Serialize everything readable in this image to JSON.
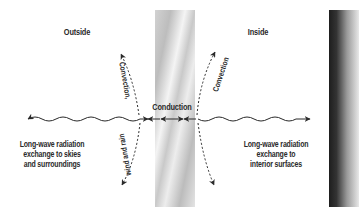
{
  "diagram": {
    "regions": {
      "outside_label": "Outside",
      "inside_label": "Inside"
    },
    "labels": {
      "conduction": "Conduction",
      "convection_outside": "Convection,",
      "wind_and_rain": "wind and rain",
      "convection_inside": "Convection",
      "longwave_outside": [
        "Long-wave radiation",
        "exchange to skies",
        "and surroundings"
      ],
      "longwave_inside": [
        "Long-wave radiation",
        "exchange to",
        "interior surfaces"
      ]
    },
    "elements": [
      {
        "id": "glazing-wall",
        "type": "wall",
        "style": "silver gradient",
        "x": 155,
        "width": 40
      },
      {
        "id": "interior-wall",
        "type": "wall",
        "style": "dark-to-light gradient",
        "x": 329,
        "width": 30
      },
      {
        "id": "outside-radiation",
        "type": "wavy-arrow",
        "direction": "bidirectional"
      },
      {
        "id": "inside-radiation",
        "type": "wavy-arrow",
        "direction": "bidirectional"
      },
      {
        "id": "conduction-arrows",
        "type": "double-arrow",
        "direction": "bidirectional"
      },
      {
        "id": "outside-convection",
        "type": "dashed-arc-arrow",
        "direction": "up-and-down"
      },
      {
        "id": "inside-convection",
        "type": "dashed-arc-arrow",
        "direction": "up-and-down"
      }
    ],
    "colors": {
      "ink": "#2a2a2a",
      "wall_dark": "#1e1e1e",
      "wall_light": "#e8e8e8"
    }
  }
}
